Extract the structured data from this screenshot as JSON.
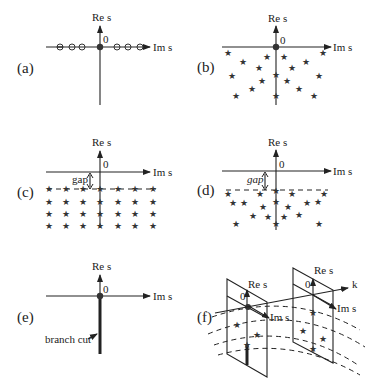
{
  "figure": {
    "axis_labels": {
      "vertical": "Re s",
      "horizontal": "Im s",
      "origin": "0"
    },
    "panels": [
      {
        "id": "a",
        "label": "(a)",
        "description": "Zeros (circles) on the imaginary axis, point at origin"
      },
      {
        "id": "b",
        "label": "(b)",
        "description": "Stars scattered in a fan below the Im s axis, point at origin"
      },
      {
        "id": "c",
        "label": "(c)",
        "description": "Regular grid of stars below a gap",
        "gap_label": "gap"
      },
      {
        "id": "d",
        "label": "(d)",
        "description": "Irregular stars below a gap",
        "gap_label": "gap"
      },
      {
        "id": "e",
        "label": "(e)",
        "description": "Branch cut along negative Re s axis",
        "branch_label": "branch cut"
      },
      {
        "id": "f",
        "label": "(f)",
        "description": "Stacked complex s-planes along k axis",
        "k_label": "k"
      }
    ]
  }
}
